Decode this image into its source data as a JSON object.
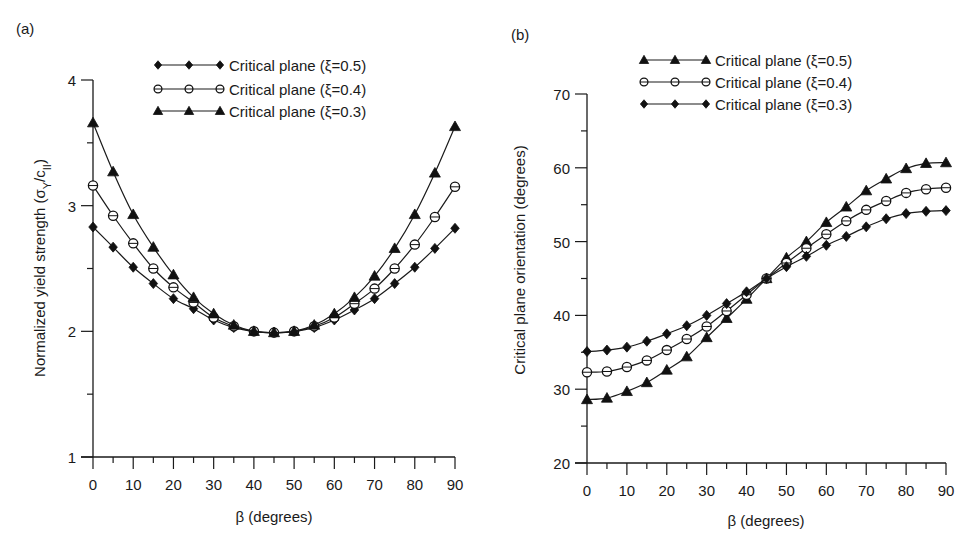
{
  "chart_data": [
    {
      "id": "a",
      "type": "line",
      "panel_label": "(a)",
      "title": "",
      "xlabel": "β (degrees)",
      "ylabel": "Normalized yield strength (σY/cII)",
      "ylabel_parts": {
        "main": "Normalized yield strength (σ",
        "sub1": "Y",
        "mid": "/c",
        "sub2": "II",
        "end": ")"
      },
      "xlim": [
        0,
        90
      ],
      "ylim": [
        1,
        4
      ],
      "xticks": [
        0,
        10,
        20,
        30,
        40,
        50,
        60,
        70,
        80,
        90
      ],
      "xminor_step": 5,
      "yticks": [
        1,
        2,
        3,
        4
      ],
      "yminor_step": 0.5,
      "grid": false,
      "legend_position": "top-center",
      "x": [
        0,
        5,
        10,
        15,
        20,
        25,
        30,
        35,
        40,
        45,
        50,
        55,
        60,
        65,
        70,
        75,
        80,
        85,
        90
      ],
      "series": [
        {
          "name": "Critical plane (ξ=0.5)",
          "marker": "diamond",
          "values": [
            2.83,
            2.67,
            2.51,
            2.38,
            2.26,
            2.18,
            2.09,
            2.03,
            2.0,
            1.99,
            2.0,
            2.03,
            2.09,
            2.17,
            2.26,
            2.38,
            2.51,
            2.66,
            2.82
          ]
        },
        {
          "name": "Critical plane (ξ=0.4)",
          "marker": "circle",
          "values": [
            3.16,
            2.92,
            2.7,
            2.5,
            2.35,
            2.23,
            2.11,
            2.04,
            2.0,
            1.99,
            2.0,
            2.04,
            2.11,
            2.22,
            2.34,
            2.5,
            2.69,
            2.91,
            3.15
          ]
        },
        {
          "name": "Critical plane (ξ=0.3)",
          "marker": "triangle",
          "values": [
            3.66,
            3.27,
            2.93,
            2.67,
            2.45,
            2.27,
            2.14,
            2.05,
            2.0,
            1.99,
            2.0,
            2.05,
            2.14,
            2.27,
            2.44,
            2.66,
            2.93,
            3.26,
            3.63
          ]
        }
      ]
    },
    {
      "id": "b",
      "type": "line",
      "panel_label": "(b)",
      "title": "",
      "xlabel": "β (degrees)",
      "ylabel": "Critical plane orientation (degrees)",
      "xlim": [
        0,
        90
      ],
      "ylim": [
        20,
        70
      ],
      "xticks": [
        0,
        10,
        20,
        30,
        40,
        50,
        60,
        70,
        80,
        90
      ],
      "xminor_step": 5,
      "yticks": [
        20,
        30,
        40,
        50,
        60,
        70
      ],
      "yminor_step": 5,
      "grid": false,
      "legend_position": "top-center",
      "x": [
        0,
        5,
        10,
        15,
        20,
        25,
        30,
        35,
        40,
        45,
        50,
        55,
        60,
        65,
        70,
        75,
        80,
        85,
        90
      ],
      "series": [
        {
          "name": "Critical plane (ξ=0.5)",
          "marker": "triangle",
          "values": [
            28.6,
            28.8,
            29.7,
            30.9,
            32.6,
            34.4,
            37.0,
            39.6,
            42.2,
            45.0,
            47.8,
            50.0,
            52.6,
            54.7,
            56.9,
            58.5,
            59.9,
            60.6,
            60.7
          ]
        },
        {
          "name": "Critical plane (ξ=0.4)",
          "marker": "circle",
          "values": [
            32.3,
            32.4,
            33.0,
            33.9,
            35.3,
            36.8,
            38.5,
            40.6,
            42.8,
            45.0,
            47.1,
            49.1,
            51.0,
            52.8,
            54.3,
            55.5,
            56.6,
            57.1,
            57.3
          ]
        },
        {
          "name": "Critical plane (ξ=0.3)",
          "marker": "diamond",
          "values": [
            35.1,
            35.3,
            35.7,
            36.5,
            37.5,
            38.6,
            40.0,
            41.6,
            43.2,
            45.0,
            46.6,
            48.0,
            49.5,
            50.7,
            52.0,
            53.1,
            53.8,
            54.1,
            54.2
          ]
        }
      ]
    }
  ],
  "colors": {
    "ink": "#1a1a1a",
    "background": "#ffffff"
  }
}
